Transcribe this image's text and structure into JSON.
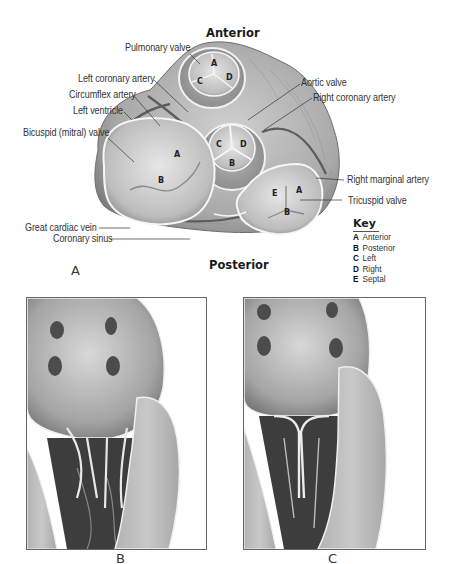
{
  "figure_a": {
    "panel_label": "A",
    "orientation": {
      "top": "Anterior",
      "bottom": "Posterior"
    },
    "labels_left": [
      "Pulmonary valve",
      "Left coronary artery",
      "Circumflex artery",
      "Left ventricle",
      "Bicuspid (mitral) valve",
      "Great cardiac vein",
      "Coronary sinus"
    ],
    "labels_right": [
      "Aortic valve",
      "Right coronary artery",
      "Right marginal artery",
      "Tricuspid valve"
    ],
    "cusp_letters": {
      "pulmonary": [
        "A",
        "C",
        "D"
      ],
      "aortic": [
        "C",
        "D",
        "B"
      ],
      "mitral": [
        "A",
        "B"
      ],
      "tricuspid": [
        "E",
        "A",
        "B"
      ]
    },
    "key": {
      "title": "Key",
      "items": [
        {
          "code": "A",
          "label": "Anterior"
        },
        {
          "code": "B",
          "label": "Posterior"
        },
        {
          "code": "C",
          "label": "Left"
        },
        {
          "code": "D",
          "label": "Right"
        },
        {
          "code": "E",
          "label": "Septal"
        }
      ]
    }
  },
  "figure_b": {
    "panel_label": "B"
  },
  "figure_c": {
    "panel_label": "C"
  },
  "colors": {
    "text": "#333333",
    "tissue_light": "#d9d9d9",
    "tissue_mid": "#a8a8a8",
    "tissue_dark": "#5a5a5a",
    "border": "#666666"
  }
}
